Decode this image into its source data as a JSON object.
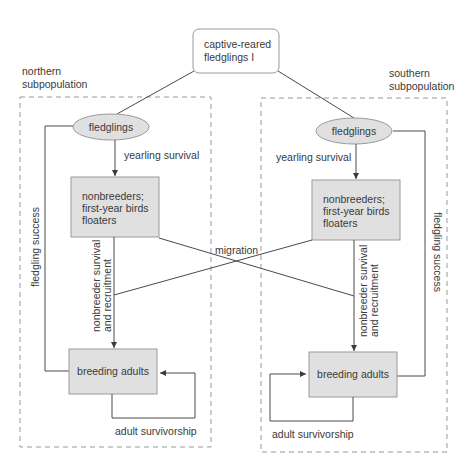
{
  "title_node": {
    "line1": "captive-reared",
    "line2": "fledglings I"
  },
  "northern": {
    "label_line1": "northern",
    "label_line2": "subpopulation",
    "fledglings": "fledglings",
    "yearling_survival": "yearling survival",
    "nonbreeders_line1": "nonbreeders;",
    "nonbreeders_line2": "first-year birds",
    "nonbreeders_line3": "floaters",
    "nonbreeder_survival_line1": "nonbreeder survival",
    "nonbreeder_survival_line2": "and recruitment",
    "breeding_adults": "breeding adults",
    "fledgling_success": "fledgling success",
    "adult_survivorship": "adult survivorship"
  },
  "southern": {
    "label_line1": "southern",
    "label_line2": "subpopulation",
    "fledglings": "fledglings",
    "yearling_survival": "yearling survival",
    "nonbreeders_line1": "nonbreeders;",
    "nonbreeders_line2": "first-year birds",
    "nonbreeders_line3": "floaters",
    "nonbreeder_survival_line1": "nonbreeder survival",
    "nonbreeder_survival_line2": "and recruitment",
    "breeding_adults": "breeding adults",
    "fledgling_success": "fledgling success",
    "adult_survivorship": "adult survivorship"
  },
  "migration": "migration",
  "colors": {
    "node_fill": "#e0e0e0",
    "node_border": "#9a9a9a",
    "line": "#4a4a4a",
    "text": "#3a3a3a"
  }
}
